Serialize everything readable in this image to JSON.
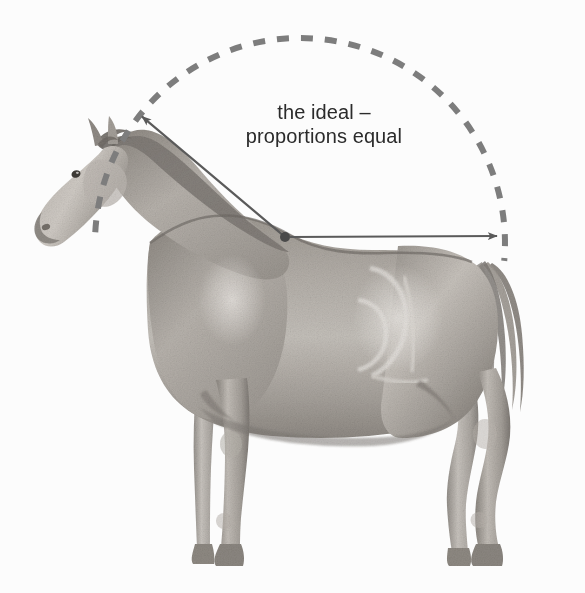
{
  "figure": {
    "name": "horse-proportions-ideal",
    "background_color": "#fcfcfc",
    "width": 585,
    "height": 593,
    "annotation": {
      "line1": "the ideal –",
      "line2": "proportions equal",
      "text_color": "#2b2b2b"
    },
    "overlay": {
      "arc": {
        "name": "dashed-circle-arc",
        "style": "dashed",
        "color": "#7d7d7d",
        "stroke_width": 6,
        "dash_pattern": "12 12",
        "center_x": 300,
        "center_y": 243,
        "radius": 205,
        "start_angle_deg": 183,
        "end_angle_deg": 5
      },
      "origin_dot": {
        "name": "withers-origin-dot",
        "x": 285,
        "y": 237,
        "radius": 5,
        "color": "#4a4a4a"
      },
      "arrow_to_withers": {
        "name": "arrow-up-left-to-withers",
        "from_x": 285,
        "from_y": 237,
        "to_x": 139,
        "to_y": 114,
        "color": "#5a5a5a"
      },
      "arrow_to_rump": {
        "name": "arrow-right-to-rump",
        "from_x": 290,
        "from_y": 237,
        "to_x": 501,
        "to_y": 236,
        "color": "#5a5a5a"
      }
    },
    "drawing_colors": {
      "coat_light": "#cfcbc6",
      "coat_mid": "#a9a49e",
      "coat_dark": "#807b76",
      "outline": "#6e6a66",
      "highlight": "#ece9e5"
    }
  }
}
